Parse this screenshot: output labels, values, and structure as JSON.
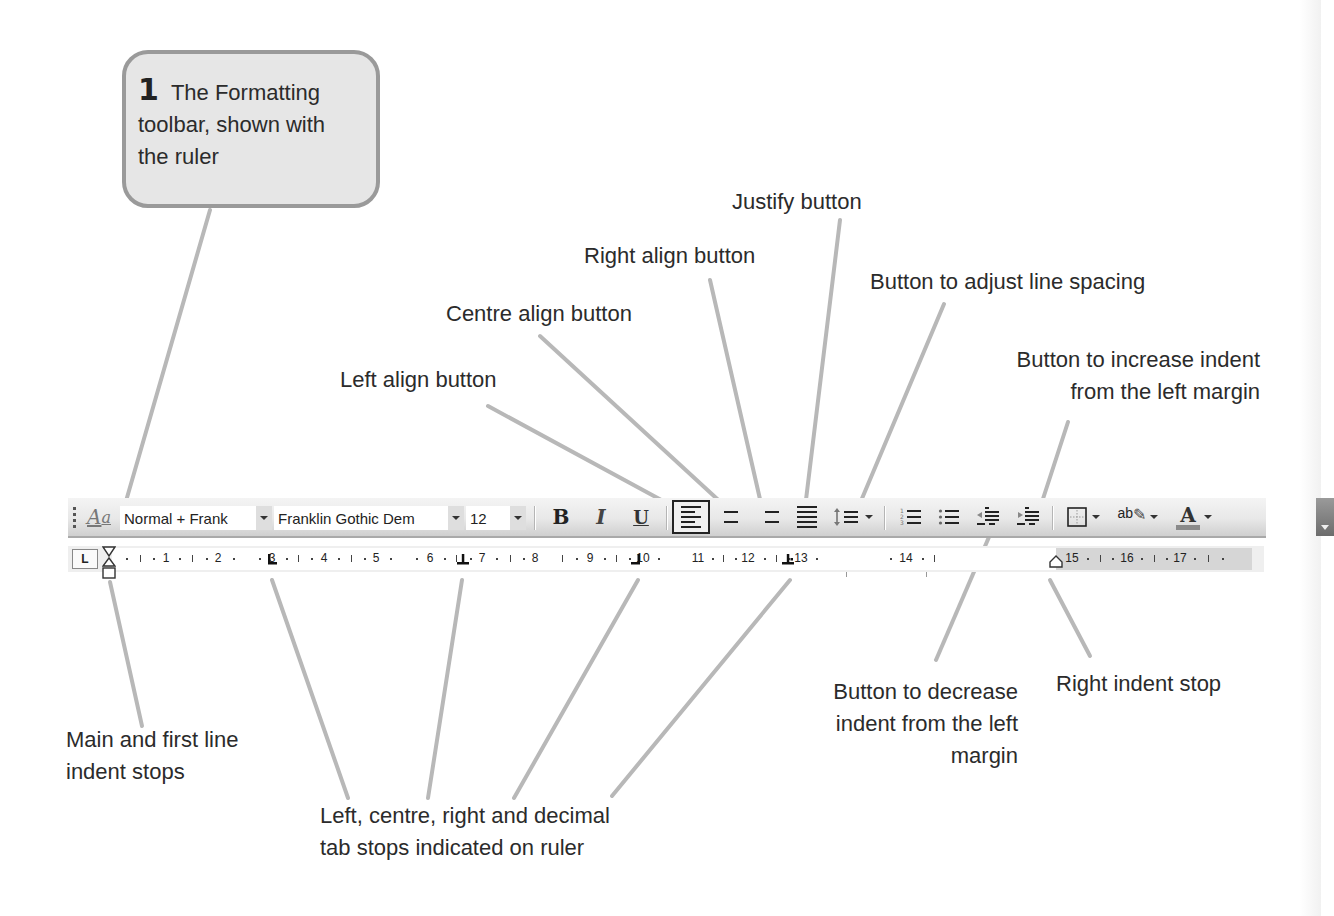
{
  "callout": {
    "number": "1",
    "text": "The Formatting toolbar, shown with the ruler",
    "line1": "The Formatting",
    "line2": "toolbar, shown with",
    "line3": "the ruler"
  },
  "annotations": {
    "justify": "Justify button",
    "right_align": "Right align button",
    "centre_align": "Centre align button",
    "left_align": "Left align button",
    "line_spacing": "Button to adjust line spacing",
    "increase_indent_1": "Button to increase indent",
    "increase_indent_2": "from the left margin",
    "decrease_indent_1": "Button to decrease",
    "decrease_indent_2": "indent from the left",
    "decrease_indent_3": "margin",
    "right_indent_stop": "Right indent stop",
    "main_indent_1": "Main and first line",
    "main_indent_2": "indent stops",
    "tab_stops_1": "Left, centre, right and decimal",
    "tab_stops_2": "tab stops indicated on ruler"
  },
  "toolbar": {
    "style_value": "Normal + Frank",
    "font_value": "Franklin Gothic Dem",
    "size_value": "12",
    "bold_label": "B",
    "italic_label": "I",
    "underline_label": "U",
    "highlight_label": "ab",
    "font_color_label": "A",
    "styles_icon_label": "A",
    "active_alignment": "left"
  },
  "ruler": {
    "tab_selector": "L",
    "numbers": [
      "1",
      "2",
      "3",
      "4",
      "5",
      "6",
      "7",
      "8",
      "9",
      "10",
      "11",
      "12",
      "13",
      "14",
      "15",
      "16",
      "17"
    ],
    "tab_stops": [
      "left",
      "centre",
      "right",
      "decimal"
    ]
  },
  "colors": {
    "leader_line": "#b8b8b8",
    "callout_fill": "#e6e6e6",
    "callout_border": "#9a9a9a",
    "toolbar_bg": "#e8e8e8",
    "text": "#2b2b2b"
  }
}
